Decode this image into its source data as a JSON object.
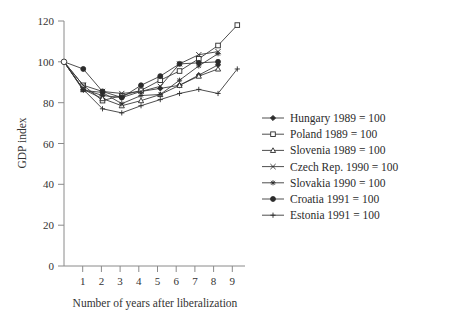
{
  "chart_data": {
    "type": "line",
    "title": "",
    "xlabel": "Number of years after liberalization",
    "ylabel": "GDP index",
    "xlim": [
      0,
      9.4
    ],
    "ylim": [
      0,
      120
    ],
    "xticks": [
      0,
      1,
      2,
      3,
      4,
      5,
      6,
      7,
      8,
      9
    ],
    "xticklabels": [
      "",
      "1",
      "2",
      "3",
      "4",
      "5",
      "6",
      "7",
      "8",
      "9"
    ],
    "yticks": [
      0,
      20,
      40,
      60,
      80,
      100,
      120
    ],
    "yticklabels": [
      "0",
      "20",
      "40",
      "60",
      "80",
      "100",
      "120"
    ],
    "grid": false,
    "legend_position": "right-middle",
    "x": [
      0,
      1,
      2,
      3,
      4,
      5,
      6,
      7,
      8,
      9
    ],
    "series": [
      {
        "name": "Hungary 1989 = 100",
        "marker": "filled-diamond",
        "values": [
          100,
          86.5,
          83.5,
          82.5,
          85.5,
          87,
          88.5,
          93.5,
          98.5,
          null
        ]
      },
      {
        "name": "Poland 1989 = 100",
        "marker": "open-square",
        "values": [
          100,
          88.5,
          81,
          83.5,
          86,
          91,
          95.5,
          101.5,
          108,
          118
        ]
      },
      {
        "name": "Slovenia 1989 = 100",
        "marker": "open-triangle",
        "values": [
          100,
          86.5,
          82,
          78.5,
          81,
          84,
          88.5,
          93,
          96.5,
          null
        ]
      },
      {
        "name": "Czech Rep. 1990 = 100",
        "marker": "x-cross",
        "values": [
          100,
          88.5,
          85.5,
          84.5,
          85.5,
          88,
          99,
          103.5,
          105,
          null
        ]
      },
      {
        "name": "Slovakia 1990 = 100",
        "marker": "star",
        "values": [
          100,
          86,
          85,
          79.5,
          83.5,
          84,
          91,
          98,
          104,
          null
        ]
      },
      {
        "name": "Croatia 1991 = 100",
        "marker": "filled-circle",
        "values": [
          100,
          96.5,
          85.5,
          82.5,
          88.5,
          93,
          99,
          99.5,
          100,
          null
        ]
      },
      {
        "name": "Estonia 1991 = 100",
        "marker": "plus",
        "values": [
          100,
          86.5,
          77,
          75,
          78.5,
          81.5,
          84.5,
          86.5,
          84.5,
          96.5
        ]
      }
    ]
  },
  "colors": {
    "ink": "#2b2b2b",
    "axis": "#8a8a8a",
    "background": "#ffffff"
  }
}
